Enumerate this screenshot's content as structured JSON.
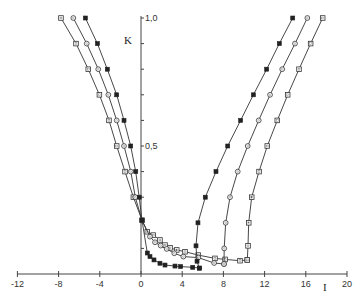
{
  "chart_data": {
    "type": "line",
    "title": "",
    "xlabel": "I",
    "ylabel": "K",
    "xlim": [
      -12,
      20
    ],
    "ylim": [
      0,
      1.0
    ],
    "x_ticks": [
      -12,
      -8,
      -4,
      0,
      4,
      8,
      12,
      16,
      20
    ],
    "x_tick_labels": [
      "-12",
      "-8",
      "-4",
      "0",
      "4",
      "8",
      "12",
      "16",
      "20"
    ],
    "y_ticks": [
      0.1,
      0.2,
      0.3,
      0.4,
      0.5,
      0.6,
      0.7,
      0.8,
      0.9,
      1.0
    ],
    "y_tick_labels": {
      "0.5": "0,5",
      "1.0": "1,0"
    },
    "grid": false,
    "legend": null,
    "series": [
      {
        "name": "left-square",
        "marker": "square-open",
        "points": [
          [
            -7.77,
            1.0
          ],
          [
            -6.31,
            0.9
          ],
          [
            -5.12,
            0.8
          ],
          [
            -4.04,
            0.7
          ],
          [
            -3.11,
            0.6
          ],
          [
            -2.36,
            0.5
          ],
          [
            -1.55,
            0.4
          ],
          [
            -0.74,
            0.3
          ],
          [
            0.1,
            0.21
          ]
        ]
      },
      {
        "name": "left-circle",
        "marker": "circle-open",
        "points": [
          [
            -6.57,
            1.0
          ],
          [
            -5.27,
            0.9
          ],
          [
            -4.15,
            0.8
          ],
          [
            -3.17,
            0.7
          ],
          [
            -2.36,
            0.6
          ],
          [
            -1.65,
            0.5
          ],
          [
            -0.99,
            0.4
          ],
          [
            -0.55,
            0.3
          ],
          [
            0.1,
            0.21
          ]
        ]
      },
      {
        "name": "left-filled",
        "marker": "square-filled",
        "points": [
          [
            -5.4,
            1.0
          ],
          [
            -4.23,
            0.9
          ],
          [
            -3.27,
            0.8
          ],
          [
            -2.36,
            0.7
          ],
          [
            -1.65,
            0.6
          ],
          [
            -1.0,
            0.5
          ],
          [
            -0.51,
            0.4
          ],
          [
            -0.17,
            0.3
          ],
          [
            0.1,
            0.21
          ]
        ]
      },
      {
        "name": "bottom-square",
        "marker": "square-open",
        "points": [
          [
            0.1,
            0.21
          ],
          [
            0.61,
            0.165
          ],
          [
            1.19,
            0.152
          ],
          [
            1.84,
            0.133
          ],
          [
            2.33,
            0.113
          ],
          [
            2.82,
            0.102
          ],
          [
            3.47,
            0.094
          ],
          [
            4.27,
            0.087
          ],
          [
            5.56,
            0.074
          ],
          [
            7.18,
            0.061
          ],
          [
            8.16,
            0.057
          ],
          [
            9.61,
            0.052
          ],
          [
            10.32,
            0.055
          ]
        ]
      },
      {
        "name": "bottom-circle",
        "marker": "circle-open",
        "points": [
          [
            0.1,
            0.21
          ],
          [
            0.87,
            0.146
          ],
          [
            1.36,
            0.124
          ],
          [
            1.91,
            0.111
          ],
          [
            2.49,
            0.098
          ],
          [
            3.23,
            0.081
          ],
          [
            4.11,
            0.068
          ],
          [
            5.56,
            0.064
          ],
          [
            7.1,
            0.043
          ],
          [
            8.06,
            0.039
          ]
        ]
      },
      {
        "name": "bottom-filled",
        "marker": "square-filled",
        "points": [
          [
            0.1,
            0.21
          ],
          [
            0.61,
            0.082
          ],
          [
            0.87,
            0.068
          ],
          [
            1.26,
            0.055
          ],
          [
            1.84,
            0.042
          ],
          [
            2.33,
            0.035
          ],
          [
            3.3,
            0.031
          ],
          [
            3.85,
            0.029
          ],
          [
            5.02,
            0.026
          ],
          [
            5.66,
            0.023
          ]
        ]
      },
      {
        "name": "right-filled",
        "marker": "square-filled",
        "points": [
          [
            5.66,
            0.023
          ],
          [
            5.44,
            0.05
          ],
          [
            5.34,
            0.11
          ],
          [
            5.53,
            0.2
          ],
          [
            6.24,
            0.3
          ],
          [
            7.28,
            0.4
          ],
          [
            8.42,
            0.5
          ],
          [
            9.67,
            0.6
          ],
          [
            10.91,
            0.7
          ],
          [
            12.2,
            0.8
          ],
          [
            13.43,
            0.9
          ],
          [
            14.73,
            1.0
          ]
        ]
      },
      {
        "name": "right-circle",
        "marker": "circle-open",
        "points": [
          [
            8.06,
            0.039
          ],
          [
            8.08,
            0.1
          ],
          [
            8.22,
            0.2
          ],
          [
            8.64,
            0.3
          ],
          [
            9.39,
            0.4
          ],
          [
            10.36,
            0.5
          ],
          [
            11.43,
            0.6
          ],
          [
            12.53,
            0.7
          ],
          [
            13.71,
            0.8
          ],
          [
            14.95,
            0.9
          ],
          [
            16.15,
            1.0
          ]
        ]
      },
      {
        "name": "right-square",
        "marker": "square-open",
        "points": [
          [
            10.32,
            0.055
          ],
          [
            10.39,
            0.11
          ],
          [
            10.46,
            0.2
          ],
          [
            10.75,
            0.3
          ],
          [
            11.46,
            0.4
          ],
          [
            12.26,
            0.5
          ],
          [
            13.23,
            0.6
          ],
          [
            14.24,
            0.7
          ],
          [
            15.34,
            0.8
          ],
          [
            16.47,
            0.9
          ],
          [
            17.64,
            1.0
          ]
        ]
      }
    ]
  },
  "axes": {
    "x_label": "I",
    "y_label": "K",
    "y_tick_05": "0,5",
    "y_tick_10": "1,0"
  }
}
